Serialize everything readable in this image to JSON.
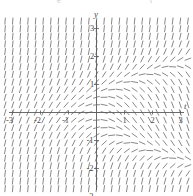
{
  "chart_data": {
    "type": "scatter",
    "subtype": "slope-field",
    "title": "",
    "xlabel": "t",
    "ylabel": "y",
    "xlim": [
      -3.4,
      3.4
    ],
    "ylim": [
      -3.4,
      3.4
    ],
    "grid": false,
    "legend": null,
    "x_ticks": [
      -3,
      -2,
      -1,
      1,
      2,
      3
    ],
    "y_ticks": [
      -3,
      -2,
      -1,
      1,
      2,
      3
    ],
    "x_tick_labels": [
      "-3",
      "-2",
      "-1",
      "1",
      "2",
      "3"
    ],
    "y_tick_labels": [
      "-3",
      "-2",
      "-1",
      "1",
      "2",
      "3"
    ],
    "field": {
      "grid_columns": 25,
      "grid_rows": 25,
      "t_min": -3.4,
      "t_max": 3.4,
      "y_min": -3.4,
      "y_max": 3.4,
      "segment_length_px": 6.2,
      "stroke_color": "#7a7a7a",
      "stroke_width": 0.9,
      "slope_expression": "y*y - t"
    }
  },
  "axes": {
    "x_axis_label": "t",
    "y_axis_label": "y",
    "axis_color": "#5a5a5a",
    "axis_width": 0.9
  },
  "colors": {
    "background": "#ffffff",
    "field_stroke": "#7a7a7a",
    "axis": "#5a5a5a",
    "text": "#4a4a4a",
    "smudge": "#c8c8c8"
  },
  "artifacts": {
    "top_marks": [
      "e",
      "t"
    ]
  }
}
